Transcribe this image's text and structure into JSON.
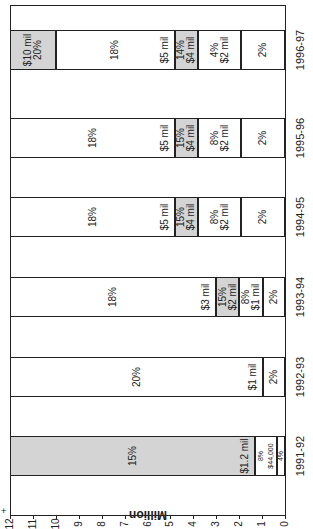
{
  "chart_data": {
    "type": "bar",
    "stacked": true,
    "orientation": "rotated-90",
    "title": "",
    "xlabel": "",
    "ylabel": "Million",
    "ylim": [
      0,
      12
    ],
    "y_ticks": [
      "0",
      "1",
      "2",
      "3",
      "4",
      "5",
      "6",
      "7",
      "8",
      "9",
      "10",
      "11",
      "12"
    ],
    "categories": [
      "1991-92",
      "1992-93",
      "1993-94",
      "1994-95",
      "1995-96",
      "1996-97"
    ],
    "bars": [
      {
        "category": "1991-92",
        "segments": [
          {
            "from": 0,
            "to": 0.35,
            "shade": false,
            "labels": [
              "4%"
            ]
          },
          {
            "from": 0.35,
            "to": 1.3,
            "shade": false,
            "labels": [
              "8%",
              "$44,000"
            ]
          },
          {
            "from": 1.3,
            "to": 12,
            "shade": true,
            "labels": [
              "$1.2 mil",
              "15%"
            ]
          }
        ]
      },
      {
        "category": "1992-93",
        "segments": [
          {
            "from": 0,
            "to": 0.95,
            "shade": false,
            "labels": [
              "2%"
            ]
          },
          {
            "from": 0.95,
            "to": 12,
            "shade": false,
            "labels": [
              "$1 mil",
              "20%"
            ]
          }
        ]
      },
      {
        "category": "1993-94",
        "segments": [
          {
            "from": 0,
            "to": 0.95,
            "shade": false,
            "labels": [
              "2%"
            ]
          },
          {
            "from": 0.95,
            "to": 2.0,
            "shade": false,
            "labels": [
              "8%",
              "$1 mil"
            ]
          },
          {
            "from": 2.0,
            "to": 3.0,
            "shade": true,
            "labels": [
              "15%",
              "$2 mil"
            ]
          },
          {
            "from": 3.0,
            "to": 12,
            "shade": false,
            "labels": [
              "$3 mil",
              "18%"
            ]
          }
        ]
      },
      {
        "category": "1994-95",
        "segments": [
          {
            "from": 0,
            "to": 1.9,
            "shade": false,
            "labels": [
              "2%"
            ]
          },
          {
            "from": 1.9,
            "to": 3.8,
            "shade": false,
            "labels": [
              "8%",
              "$2 mil"
            ]
          },
          {
            "from": 3.8,
            "to": 4.8,
            "shade": true,
            "labels": [
              "15%",
              "$4 mil"
            ]
          },
          {
            "from": 4.8,
            "to": 12,
            "shade": false,
            "labels": [
              "$5 mil",
              "18%"
            ]
          }
        ]
      },
      {
        "category": "1995-96",
        "segments": [
          {
            "from": 0,
            "to": 1.9,
            "shade": false,
            "labels": [
              "2%"
            ]
          },
          {
            "from": 1.9,
            "to": 3.8,
            "shade": false,
            "labels": [
              "8%",
              "$2 mil"
            ]
          },
          {
            "from": 3.8,
            "to": 4.8,
            "shade": true,
            "labels": [
              "15%",
              "$4 mil"
            ]
          },
          {
            "from": 4.8,
            "to": 12,
            "shade": false,
            "labels": [
              "$5 mil",
              "18%"
            ]
          }
        ]
      },
      {
        "category": "1996-97",
        "segments": [
          {
            "from": 0,
            "to": 1.9,
            "shade": false,
            "labels": [
              "2%"
            ]
          },
          {
            "from": 1.9,
            "to": 3.8,
            "shade": false,
            "labels": [
              "4%",
              "$2 mil"
            ]
          },
          {
            "from": 3.8,
            "to": 4.8,
            "shade": true,
            "labels": [
              "14%",
              "$4 mil"
            ]
          },
          {
            "from": 4.8,
            "to": 10.0,
            "shade": false,
            "labels": [
              "$5 mil",
              "18%"
            ]
          },
          {
            "from": 10.0,
            "to": 12,
            "shade": true,
            "labels": [
              "$10 mil",
              "20%"
            ]
          }
        ]
      }
    ],
    "grid": false,
    "legend": null
  },
  "axis": {
    "label": "Million",
    "plus_mark": "+"
  }
}
